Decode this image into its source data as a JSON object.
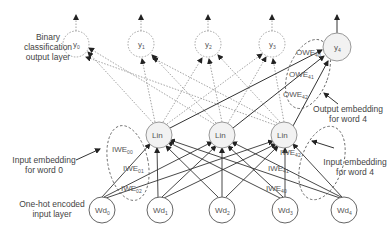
{
  "labels": {
    "output_layer": [
      "Binary",
      "classification",
      "output layer"
    ],
    "output_embedding": [
      "Output embedding",
      "for word 4"
    ],
    "input_embedding_0": [
      "Input embedding",
      "for word 0"
    ],
    "input_embedding_4": [
      "Input embedding",
      "for word 4"
    ],
    "input_layer": [
      "One-hot encoded",
      "input layer"
    ]
  },
  "nodes": {
    "outputs": [
      {
        "base": "y",
        "sub": "0"
      },
      {
        "base": "y",
        "sub": "1"
      },
      {
        "base": "y",
        "sub": "2"
      },
      {
        "base": "y",
        "sub": "3"
      },
      {
        "base": "y",
        "sub": "4"
      }
    ],
    "hidden": [
      {
        "base": "Lin"
      },
      {
        "base": "Lin"
      },
      {
        "base": "Lin"
      }
    ],
    "inputs": [
      {
        "base": "Wd",
        "sub": "0"
      },
      {
        "base": "Wd",
        "sub": "1"
      },
      {
        "base": "Wd",
        "sub": "2"
      },
      {
        "base": "Wd",
        "sub": "3"
      },
      {
        "base": "Wd",
        "sub": "4"
      }
    ]
  },
  "edge_labels": {
    "owe": [
      {
        "base": "OWE",
        "sub": "40"
      },
      {
        "base": "OWE",
        "sub": "41"
      },
      {
        "base": "OWE",
        "sub": "42"
      }
    ],
    "iwe0": [
      {
        "base": "IWE",
        "sub": "00"
      },
      {
        "base": "IWE",
        "sub": "01"
      },
      {
        "base": "IWE",
        "sub": "02"
      }
    ],
    "iwe4": [
      {
        "base": "IWE",
        "sub": "42"
      },
      {
        "base": "IWE",
        "sub": "41"
      },
      {
        "base": "IWE",
        "sub": "40"
      }
    ]
  },
  "colors": {
    "line": "#333333",
    "dotted": "#888888",
    "node_stroke": "#666666",
    "node_fill_hidden": "#f2f2f2"
  }
}
